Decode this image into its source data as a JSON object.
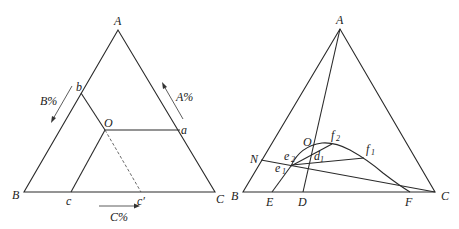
{
  "left_diagram": {
    "title": "ternary composition triangle",
    "vertices": {
      "A": "A",
      "B": "B",
      "C": "C"
    },
    "points": {
      "b": "b",
      "O": "O",
      "a": "a",
      "c": "c",
      "c_prime": "c′"
    },
    "axis_labels": {
      "A_pct": "A%",
      "B_pct": "B%",
      "C_pct": "C%"
    }
  },
  "right_diagram": {
    "title": "ternary phase diagram with binodal curve",
    "vertices": {
      "A": "A",
      "B": "B",
      "C": "C"
    },
    "points": {
      "O": "O",
      "N": "N",
      "E": "E",
      "D": "D",
      "F": "F",
      "e": "e",
      "e2_sub": "2",
      "e1_sub": "1",
      "d": "d",
      "d1_sub": "1",
      "f": "f",
      "f2_sub": "2",
      "f1_sub": "1"
    }
  },
  "colors": {
    "line": "#2a2a2a",
    "text": "#222222",
    "background": "#ffffff"
  }
}
